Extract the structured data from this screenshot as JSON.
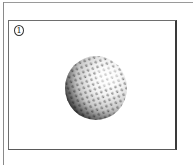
{
  "panel": {
    "number": "1",
    "illustration": "golf-ball"
  },
  "colors": {
    "background": "#ffffff",
    "border": "#3a3a3a",
    "ball_shadow": "#1e1e1e",
    "ball_highlight": "#ffffff"
  }
}
